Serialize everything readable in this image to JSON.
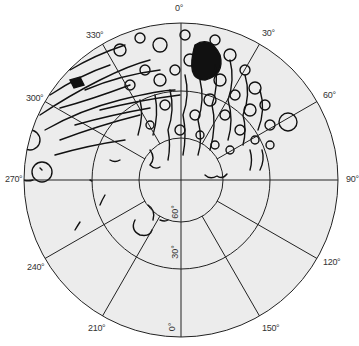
{
  "map": {
    "type": "polar-projection",
    "colors": {
      "disc_fill": "#ececec",
      "grid_line": "#222222",
      "terrain": "#111111",
      "background": "#ffffff"
    },
    "longitude_labels": [
      {
        "label": "0°",
        "x": 175,
        "y": 3
      },
      {
        "label": "30°",
        "x": 262,
        "y": 28
      },
      {
        "label": "60°",
        "x": 323,
        "y": 90
      },
      {
        "label": "90°",
        "x": 346,
        "y": 174
      },
      {
        "label": "120°",
        "x": 323,
        "y": 257
      },
      {
        "label": "150°",
        "x": 262,
        "y": 323
      },
      {
        "label": "210°",
        "x": 88,
        "y": 323
      },
      {
        "label": "240°",
        "x": 27,
        "y": 262
      },
      {
        "label": "270°",
        "x": 5,
        "y": 174
      },
      {
        "label": "300°",
        "x": 26,
        "y": 93
      },
      {
        "label": "330°",
        "x": 86,
        "y": 30
      }
    ],
    "latitude_labels": [
      {
        "label": "60°",
        "x": 176,
        "y": 207
      },
      {
        "label": "30°",
        "x": 176,
        "y": 247
      },
      {
        "label": "0°",
        "x": 176,
        "y": 322
      }
    ]
  }
}
